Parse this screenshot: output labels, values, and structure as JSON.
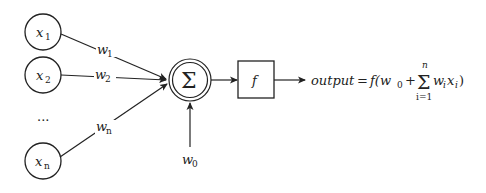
{
  "diagram": {
    "colors": {
      "stroke": "#222222",
      "background": "#ffffff"
    },
    "inputs": [
      {
        "var": "x",
        "sub": "1",
        "weight_var": "w",
        "weight_sub": "1"
      },
      {
        "var": "x",
        "sub": "2",
        "weight_var": "w",
        "weight_sub": "2"
      },
      {
        "var": "x",
        "sub": "n",
        "weight_var": "w",
        "weight_sub": "n"
      }
    ],
    "ellipsis": "...",
    "summation": {
      "symbol": "Σ"
    },
    "bias": {
      "var": "w",
      "sub": "0"
    },
    "activation": {
      "symbol": "f"
    },
    "output_formula": {
      "lhs": "output",
      "eq": "=",
      "func_open": "f(w",
      "bias_sub": "0",
      "plus": "+",
      "sum_symbol": "Σ",
      "sum_upper": "n",
      "sum_lower": "i=1",
      "term_w": "w",
      "term_w_sub": "i",
      "term_x": "x",
      "term_x_sub": "i",
      "close": ")"
    }
  }
}
